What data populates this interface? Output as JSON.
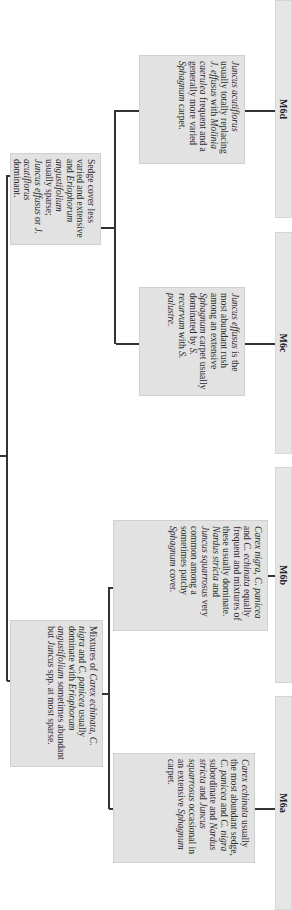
{
  "diagram": {
    "type": "key-tree",
    "orientation": "rotated-90-clockwise",
    "level1": [
      {
        "id": "sedge-less",
        "text_parts": [
          {
            "t": "Sedge cover less varied and extensive and ",
            "i": false
          },
          {
            "t": "Eriophorum angustifolium",
            "i": true
          },
          {
            "t": " usually sparse; ",
            "i": false
          },
          {
            "t": "Juncus effusus",
            "i": true
          },
          {
            "t": " or ",
            "i": false
          },
          {
            "t": "J. acutiflorus",
            "i": true
          },
          {
            "t": " dominant.",
            "i": false
          }
        ],
        "children": [
          "M6c",
          "M6d"
        ]
      },
      {
        "id": "mixtures",
        "text_parts": [
          {
            "t": "Mixtures of ",
            "i": false
          },
          {
            "t": "Carex echinata, C. nigra",
            "i": true
          },
          {
            "t": " and ",
            "i": false
          },
          {
            "t": "C. panicea",
            "i": true
          },
          {
            "t": " usually dominate with ",
            "i": false
          },
          {
            "t": "Eriophorum angustifolium",
            "i": true
          },
          {
            "t": " sometimes abundant but ",
            "i": false
          },
          {
            "t": "Juncus",
            "i": true
          },
          {
            "t": " spp. at most sparse.",
            "i": false
          }
        ],
        "children": [
          "M6a",
          "M6b"
        ]
      }
    ],
    "level2": {
      "M6d": [
        {
          "t": "Juncus acutiflorus",
          "i": true
        },
        {
          "t": " usually totally replacing ",
          "i": false
        },
        {
          "t": "J. effusus",
          "i": true
        },
        {
          "t": " with ",
          "i": false
        },
        {
          "t": "Molinia caerulea",
          "i": true
        },
        {
          "t": " frequent and a generally more varied ",
          "i": false
        },
        {
          "t": "Sphagnum",
          "i": true
        },
        {
          "t": " carpet.",
          "i": false
        }
      ],
      "M6c": [
        {
          "t": "Juncus effusus",
          "i": true
        },
        {
          "t": " is the most abundant rush among an extensive ",
          "i": false
        },
        {
          "t": "Sphagnum",
          "i": true
        },
        {
          "t": " carpet usually dominated by ",
          "i": false
        },
        {
          "t": "S. recurvum",
          "i": true
        },
        {
          "t": " with ",
          "i": false
        },
        {
          "t": "S. palustre.",
          "i": true
        }
      ],
      "M6b": [
        {
          "t": "Carex nigra, C. panicea",
          "i": true
        },
        {
          "t": " and ",
          "i": false
        },
        {
          "t": "C. echinata",
          "i": true
        },
        {
          "t": " equally frequent and mixtures of these usually dominate. ",
          "i": false
        },
        {
          "t": "Nardus stricta",
          "i": true
        },
        {
          "t": " and ",
          "i": false
        },
        {
          "t": "Juncus squarrosus",
          "i": true
        },
        {
          "t": " very common among a sometimes patchy ",
          "i": false
        },
        {
          "t": "Sphagnum",
          "i": true
        },
        {
          "t": " cover.",
          "i": false
        }
      ],
      "M6a": [
        {
          "t": "Carex echinata",
          "i": true
        },
        {
          "t": " usually the most abundant sedge, ",
          "i": false
        },
        {
          "t": "C. panicea",
          "i": true
        },
        {
          "t": " and ",
          "i": false
        },
        {
          "t": "C. nigra",
          "i": true
        },
        {
          "t": " subordinate and ",
          "i": false
        },
        {
          "t": "Nardus stricta",
          "i": true
        },
        {
          "t": " and ",
          "i": false
        },
        {
          "t": "Juncus squarrosus",
          "i": true
        },
        {
          "t": " occasional in an extensive ",
          "i": false
        },
        {
          "t": "Sphagnum",
          "i": true
        },
        {
          "t": " carpet.",
          "i": false
        }
      ]
    },
    "labels": {
      "M6a": "M6a",
      "M6b": "M6b",
      "M6c": "M6c",
      "M6d": "M6d"
    },
    "colors": {
      "box_fill": "#e2e2e2",
      "bar_fill": "#e6e6e6",
      "line": "#333333"
    }
  }
}
